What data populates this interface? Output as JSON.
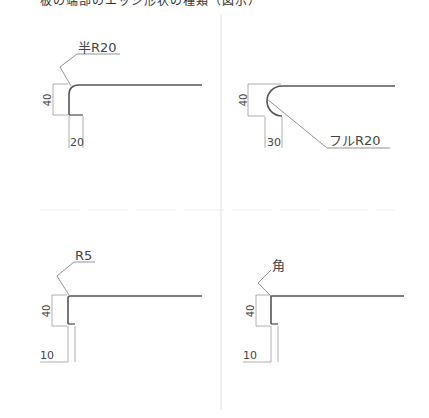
{
  "caption": "板の端部のエッジ形状の種類（図示）",
  "panels": [
    {
      "id": "half-r20",
      "callout": "半R20",
      "height_dim": "40",
      "width_dim": "20"
    },
    {
      "id": "full-r20",
      "callout": "フルR20",
      "height_dim": "40",
      "width_dim": "30"
    },
    {
      "id": "r5",
      "callout": "R5",
      "height_dim": "40",
      "width_dim": "10"
    },
    {
      "id": "square",
      "callout": "角",
      "height_dim": "40",
      "width_dim": "10"
    }
  ],
  "colors": {
    "line": "#555555",
    "dim": "#888888",
    "divider": "#e6e6e6"
  }
}
